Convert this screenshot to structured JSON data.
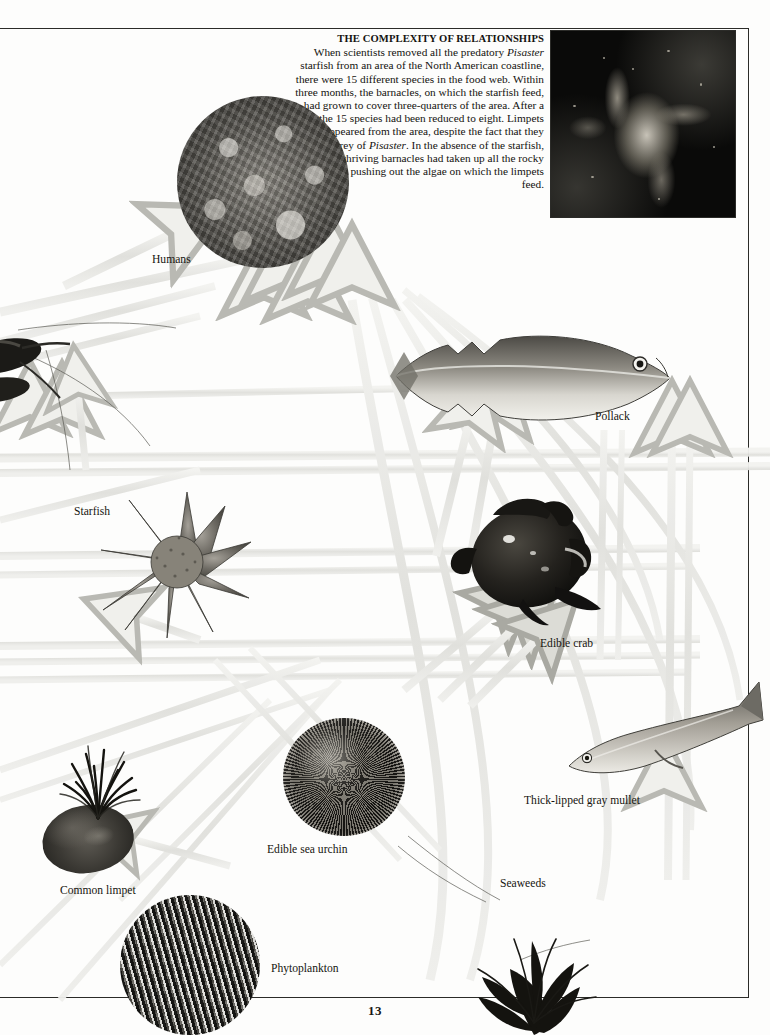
{
  "page": {
    "number": "13",
    "background_color": "#fdfdfc",
    "rule_color": "#2b2b28",
    "ribbon_color": "#e3e3df"
  },
  "article": {
    "heading": "THE COMPLEXITY OF RELATIONSHIPS",
    "body_segments": [
      {
        "text": "When scientists removed all the predatory ",
        "style": "normal"
      },
      {
        "text": "Pisaster",
        "style": "italic"
      },
      {
        "text": " starfish from an area of the North American coastline, there were 15 different species in the food web. Within three months, the barnacles, on which the starfish feed, had grown to cover three-quarters of the area. After a year, the 15 species had been reduced to eight. Limpets had disappeared from the area, despite the fact that they are the prey of ",
        "style": "normal"
      },
      {
        "text": "Pisaster",
        "style": "italic"
      },
      {
        "text": ". In the absence of the starfish, the thriving barnacles had taken up all the rocky surfaces, pushing out the algae on which the limpets feed.",
        "style": "normal"
      }
    ],
    "body_plain": "When scientists removed all the predatory Pisaster starfish from an area of the North American coastline, there were 15 different species in the food web. Within three months, the barnacles, on which the starfish feed, had grown to cover three-quarters of the area. After a year, the 15 species had been reduced to eight. Limpets had disappeared from the area, despite the fact that they are the prey of Pisaster. In the absence of the starfish, the thriving barnacles had taken up all the rocky surfaces, pushing out the algae on which the limpets feed."
  },
  "organisms": [
    {
      "id": "humans",
      "label": "Humans",
      "label_x": 152,
      "label_y": 253,
      "photo": "crowd-photo-circle"
    },
    {
      "id": "pollack",
      "label": "Pollack",
      "label_x": 595,
      "label_y": 410,
      "photo": "pollack-fish-photo"
    },
    {
      "id": "starfish",
      "label": "Starfish",
      "label_x": 74,
      "label_y": 505,
      "photo": "starfish-photo"
    },
    {
      "id": "crab",
      "label": "Edible crab",
      "label_x": 540,
      "label_y": 637,
      "photo": "edible-crab-photo"
    },
    {
      "id": "mullet",
      "label": "Thick-lipped gray mullet",
      "label_x": 524,
      "label_y": 794,
      "photo": "gray-mullet-photo"
    },
    {
      "id": "urchin",
      "label": "Edible sea urchin",
      "label_x": 267,
      "label_y": 843,
      "photo": "sea-urchin-photo"
    },
    {
      "id": "limpet",
      "label": "Common limpet",
      "label_x": 60,
      "label_y": 884,
      "photo": "common-limpet-photo"
    },
    {
      "id": "seaweeds",
      "label": "Seaweeds",
      "label_x": 500,
      "label_y": 877,
      "photo": "seaweeds-photo"
    },
    {
      "id": "phytoplankton",
      "label": "Phytoplankton",
      "label_x": 271,
      "label_y": 962,
      "photo": "phytoplankton-photo-circle"
    }
  ],
  "inset_photo": {
    "name": "pisaster-starfish-inset",
    "x": 551,
    "y": 31,
    "width": 184,
    "height": 186
  }
}
